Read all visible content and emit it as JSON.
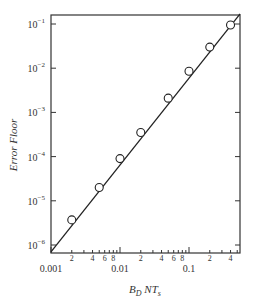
{
  "chart_data": {
    "type": "line",
    "title": "",
    "xlabel": "B_D NT_s",
    "ylabel": "Error Floor",
    "xscale": "log",
    "yscale": "log",
    "xlim": [
      0.001,
      0.55
    ],
    "ylim": [
      7e-07,
      0.17
    ],
    "grid": false,
    "legend": null,
    "x_major_ticks": [
      {
        "value": 0.001,
        "label": "0.001"
      },
      {
        "value": 0.01,
        "label": "0.01"
      },
      {
        "value": 0.1,
        "label": "0.1"
      }
    ],
    "x_minor_labels": [
      {
        "value": 0.002,
        "label": "2"
      },
      {
        "value": 0.004,
        "label": "4"
      },
      {
        "value": 0.006,
        "label": "6"
      },
      {
        "value": 0.008,
        "label": "8"
      },
      {
        "value": 0.02,
        "label": "2"
      },
      {
        "value": 0.04,
        "label": "4"
      },
      {
        "value": 0.06,
        "label": "6"
      },
      {
        "value": 0.08,
        "label": "8"
      },
      {
        "value": 0.2,
        "label": "2"
      },
      {
        "value": 0.4,
        "label": "4"
      }
    ],
    "y_major_ticks": [
      {
        "value": 0.1,
        "base": "10",
        "exp": "−1"
      },
      {
        "value": 0.01,
        "base": "10",
        "exp": "−2"
      },
      {
        "value": 0.001,
        "base": "10",
        "exp": "−3"
      },
      {
        "value": 0.0001,
        "base": "10",
        "exp": "−4"
      },
      {
        "value": 1e-05,
        "base": "10",
        "exp": "−5"
      },
      {
        "value": 1e-06,
        "base": "10",
        "exp": "−6"
      }
    ],
    "series": [
      {
        "name": "Error floor (markers)",
        "marker": "open-circle",
        "x": [
          0.002,
          0.005,
          0.01,
          0.02,
          0.05,
          0.1,
          0.2,
          0.4
        ],
        "values": [
          3.7e-06,
          2e-05,
          9e-05,
          0.00035,
          0.0021,
          0.0085,
          0.03,
          0.095
        ]
      },
      {
        "name": "Fitted line",
        "marker": "none",
        "x": [
          0.001,
          0.55
        ],
        "values": [
          7e-07,
          0.17
        ]
      }
    ]
  },
  "labels": {
    "ylabel": "Error Floor",
    "xlabel_main": "B",
    "xlabel_sub1": "D",
    "xlabel_mid": " NT",
    "xlabel_sub2": "s"
  },
  "colors": {
    "axis": "#333333",
    "line": "#222222",
    "marker_fill": "#ffffff"
  }
}
